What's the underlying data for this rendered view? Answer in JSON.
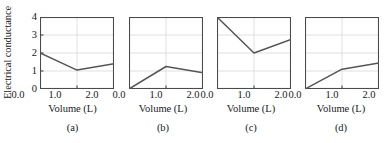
{
  "figure": {
    "ylabel": "Electrical conductance",
    "y_ticks": [
      "0",
      "1",
      "2",
      "3",
      "4"
    ],
    "x_ticks": [
      "0.0",
      "1.0",
      "2.0"
    ],
    "axis_title": "Volume (L)",
    "line_color": "#555555",
    "axis_color": "#4a4a4a",
    "grid_color": "#d8d8d8"
  },
  "chart_data": [
    {
      "type": "line",
      "panel_label": "(a)",
      "title": "",
      "xlabel": "Volume (L)",
      "ylabel": "Electrical conductance",
      "xlim": [
        0.0,
        2.0
      ],
      "ylim": [
        0,
        4
      ],
      "xticks": [
        0.0,
        1.0,
        2.0
      ],
      "yticks": [
        0,
        1,
        2,
        3,
        4
      ],
      "grid": true,
      "x": [
        0.0,
        1.0,
        2.0
      ],
      "values": [
        2.0,
        1.05,
        1.4
      ]
    },
    {
      "type": "line",
      "panel_label": "(b)",
      "title": "",
      "xlabel": "Volume (L)",
      "ylabel": "Electrical conductance",
      "xlim": [
        0.0,
        2.0
      ],
      "ylim": [
        0,
        4
      ],
      "xticks": [
        0.0,
        1.0,
        2.0
      ],
      "yticks": [
        0,
        1,
        2,
        3,
        4
      ],
      "grid": true,
      "x": [
        0.0,
        1.0,
        2.0
      ],
      "values": [
        0.0,
        1.25,
        0.9
      ]
    },
    {
      "type": "line",
      "panel_label": "(c)",
      "title": "",
      "xlabel": "Volume (L)",
      "ylabel": "Electrical conductance",
      "xlim": [
        0.0,
        2.0
      ],
      "ylim": [
        0,
        4
      ],
      "xticks": [
        0.0,
        1.0,
        2.0
      ],
      "yticks": [
        0,
        1,
        2,
        3,
        4
      ],
      "grid": true,
      "x": [
        0.0,
        1.0,
        2.0
      ],
      "values": [
        4.0,
        2.0,
        2.75
      ]
    },
    {
      "type": "line",
      "panel_label": "(d)",
      "title": "",
      "xlabel": "Volume (L)",
      "ylabel": "Electrical conductance",
      "xlim": [
        0.0,
        2.0
      ],
      "ylim": [
        0,
        4
      ],
      "xticks": [
        0.0,
        1.0,
        2.0
      ],
      "yticks": [
        0,
        1,
        2,
        3,
        4
      ],
      "grid": true,
      "x": [
        0.0,
        1.0,
        2.0
      ],
      "values": [
        0.0,
        1.1,
        1.45
      ]
    }
  ]
}
